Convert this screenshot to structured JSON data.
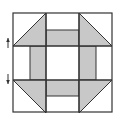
{
  "diagram": {
    "grid": "3x3",
    "colors": {
      "fill": "#c8c8c8",
      "line": "#333333",
      "background": "#ffffff"
    },
    "block": {
      "x": 13,
      "y": 13,
      "size": 99
    },
    "grid_lines": {
      "cols": [
        46,
        79
      ],
      "rows": [
        46,
        80
      ]
    },
    "corner_triangles": [
      {
        "name": "top-left",
        "points": "46,13 46,46 13,46"
      },
      {
        "name": "top-right",
        "points": "79,13 79,46 112,46"
      },
      {
        "name": "bottom-left",
        "points": "13,80 46,80 46,113"
      },
      {
        "name": "bottom-right",
        "points": "79,80 112,80 79,113"
      }
    ],
    "strips": [
      {
        "name": "top",
        "x": 46,
        "y": 30,
        "w": 33,
        "h": 16
      },
      {
        "name": "bottom",
        "x": 46,
        "y": 80,
        "w": 33,
        "h": 16
      },
      {
        "name": "left",
        "x": 30,
        "y": 46,
        "w": 16,
        "h": 34
      },
      {
        "name": "right",
        "x": 79,
        "y": 46,
        "w": 17,
        "h": 34
      }
    ],
    "arrows": [
      {
        "name": "up",
        "x": 8,
        "y1": 48,
        "y2": 38
      },
      {
        "name": "down",
        "x": 8,
        "y1": 74,
        "y2": 84
      }
    ]
  }
}
